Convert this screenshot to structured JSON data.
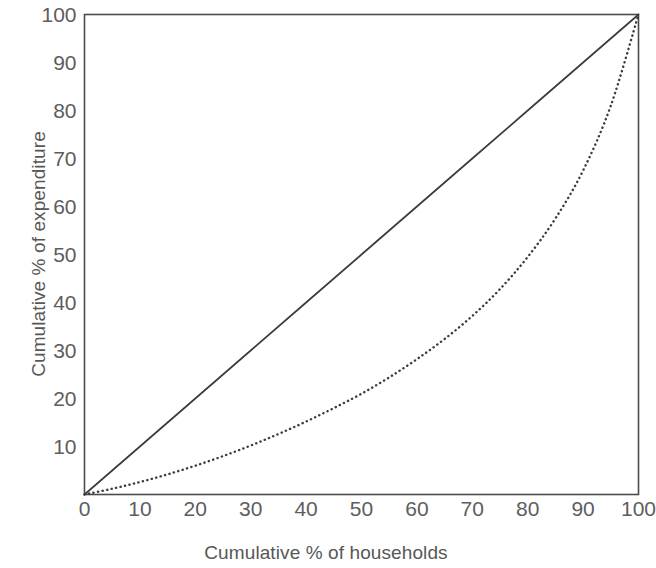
{
  "chart_data": {
    "type": "line",
    "title": "",
    "subtitle": "",
    "xlabel": "Cumulative % of households",
    "ylabel": "Cumulative % of expenditure",
    "xlim": [
      0,
      100
    ],
    "ylim": [
      0,
      100
    ],
    "xticks": [
      "0",
      "10",
      "20",
      "30",
      "40",
      "50",
      "60",
      "70",
      "80",
      "90",
      "100"
    ],
    "yticks": [
      "10",
      "20",
      "30",
      "40",
      "50",
      "60",
      "70",
      "80",
      "90",
      "100"
    ],
    "xtick_values": [
      0,
      10,
      20,
      30,
      40,
      50,
      60,
      70,
      80,
      90,
      100
    ],
    "ytick_values": [
      10,
      20,
      30,
      40,
      50,
      60,
      70,
      80,
      90,
      100
    ],
    "grid": false,
    "legend": "none",
    "frame": "full-box",
    "line_color": "#3c3c3c",
    "series": [
      {
        "name": "Line of equality",
        "style": "solid",
        "x": [
          0,
          10,
          20,
          30,
          40,
          50,
          60,
          70,
          80,
          90,
          100
        ],
        "values": [
          0,
          10,
          20,
          30,
          40,
          50,
          60,
          70,
          80,
          90,
          100
        ]
      },
      {
        "name": "Lorenz curve",
        "style": "dotted",
        "x": [
          0,
          5,
          10,
          15,
          20,
          25,
          30,
          35,
          40,
          45,
          50,
          55,
          60,
          65,
          70,
          75,
          80,
          85,
          90,
          95,
          100
        ],
        "values": [
          0,
          1.2,
          2.6,
          4.2,
          6.0,
          8.0,
          10.2,
          12.6,
          15.2,
          18.0,
          21.0,
          24.4,
          28.2,
          32.4,
          37.2,
          42.8,
          49.5,
          57.5,
          67.5,
          81.0,
          100
        ]
      }
    ]
  }
}
